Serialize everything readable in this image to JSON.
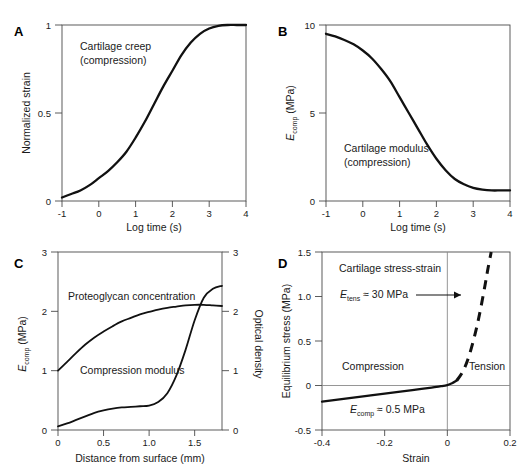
{
  "figure": {
    "caption_fragment": ""
  },
  "panels": {
    "A": {
      "letter": "A",
      "annotation_line1": "Cartilage creep",
      "annotation_line2": "(compression)",
      "xlabel": "Log time (s)",
      "ylabel": "Normalized strain",
      "xticks": [
        "-1",
        "0",
        "1",
        "2",
        "3",
        "4"
      ],
      "yticks": [
        "0",
        "0.5",
        "1"
      ]
    },
    "B": {
      "letter": "B",
      "annotation_line1": "Cartilage modulus",
      "annotation_line2": "(compression)",
      "xlabel": "Log time (s)",
      "ylabel_main": "E",
      "ylabel_sub": "comp",
      "ylabel_unit": " (MPa)",
      "xticks": [
        "-1",
        "0",
        "1",
        "2",
        "3",
        "4"
      ],
      "yticks": [
        "0",
        "5",
        "10"
      ]
    },
    "C": {
      "letter": "C",
      "annotation_upper": "Proteoglycan concentration",
      "annotation_lower": "Compression modulus",
      "xlabel": "Distance from surface (mm)",
      "ylabel_left_main": "E",
      "ylabel_left_sub": "comp",
      "ylabel_left_unit": " (MPa)",
      "ylabel_right": "Optical density",
      "xticks": [
        "0",
        "0.5",
        "1.0",
        "1.5"
      ],
      "yticks_left": [
        "0",
        "1",
        "2",
        "3"
      ],
      "yticks_right": [
        "0",
        "1",
        "2",
        "3"
      ]
    },
    "D": {
      "letter": "D",
      "title": "Cartilage stress-strain",
      "label_compression": "Compression",
      "label_tension": "Tension",
      "annot_tens_main": "E",
      "annot_tens_sub": "tens",
      "annot_tens_rest": " ≈ 30 MPa",
      "annot_comp_main": "E",
      "annot_comp_sub": "comp",
      "annot_comp_rest": " ≈ 0.5 MPa",
      "xlabel": "Strain",
      "ylabel": "Equilibrium stress (MPa)",
      "xticks": [
        "-0.4",
        "-0.2",
        "0",
        "0.2"
      ],
      "yticks": [
        "-0.5",
        "0",
        "0.5",
        "1.0",
        "1.5"
      ]
    }
  },
  "chart_data": [
    {
      "panel": "A",
      "type": "line",
      "title": "Cartilage creep (compression)",
      "xlabel": "Log time (s)",
      "ylabel": "Normalized strain",
      "xlim": [
        -1,
        4
      ],
      "ylim": [
        0,
        1
      ],
      "grid": false,
      "series": [
        {
          "name": "Normalized creep strain",
          "x": [
            -1.0,
            -0.75,
            -0.5,
            -0.25,
            0.0,
            0.25,
            0.5,
            0.75,
            1.0,
            1.25,
            1.5,
            1.75,
            2.0,
            2.25,
            2.5,
            2.75,
            3.0,
            3.25,
            3.5,
            3.75,
            4.0
          ],
          "y": [
            0.02,
            0.04,
            0.06,
            0.09,
            0.13,
            0.17,
            0.22,
            0.28,
            0.36,
            0.45,
            0.55,
            0.65,
            0.74,
            0.83,
            0.9,
            0.95,
            0.98,
            0.995,
            1.0,
            1.0,
            1.0
          ]
        }
      ]
    },
    {
      "panel": "B",
      "type": "line",
      "title": "Cartilage modulus (compression)",
      "xlabel": "Log time (s)",
      "ylabel": "E_comp (MPa)",
      "xlim": [
        -1,
        4
      ],
      "ylim": [
        0,
        10
      ],
      "grid": false,
      "series": [
        {
          "name": "Compressive modulus",
          "x": [
            -1.0,
            -0.75,
            -0.5,
            -0.25,
            0.0,
            0.25,
            0.5,
            0.75,
            1.0,
            1.25,
            1.5,
            1.75,
            2.0,
            2.25,
            2.5,
            2.75,
            3.0,
            3.25,
            3.5,
            3.75,
            4.0
          ],
          "y": [
            9.5,
            9.35,
            9.15,
            8.9,
            8.55,
            8.1,
            7.5,
            6.8,
            5.9,
            5.0,
            4.1,
            3.2,
            2.4,
            1.75,
            1.25,
            0.95,
            0.75,
            0.65,
            0.6,
            0.6,
            0.6
          ]
        }
      ]
    },
    {
      "panel": "C",
      "type": "line",
      "title": "Depth-dependent cartilage properties",
      "xlabel": "Distance from surface (mm)",
      "ylabel_left": "E_comp (MPa)",
      "ylabel_right": "Optical density",
      "xlim": [
        0,
        1.8
      ],
      "ylim_left": [
        0,
        3
      ],
      "ylim_right": [
        0,
        3
      ],
      "grid": false,
      "series": [
        {
          "name": "Proteoglycan concentration",
          "axis": "right",
          "x": [
            0.0,
            0.1,
            0.2,
            0.3,
            0.4,
            0.5,
            0.6,
            0.7,
            0.8,
            0.9,
            1.0,
            1.1,
            1.2,
            1.3,
            1.4,
            1.5,
            1.6,
            1.7,
            1.8
          ],
          "y": [
            1.0,
            1.15,
            1.3,
            1.44,
            1.56,
            1.66,
            1.75,
            1.83,
            1.89,
            1.95,
            1.99,
            2.03,
            2.06,
            2.08,
            2.1,
            2.11,
            2.11,
            2.1,
            2.09
          ]
        },
        {
          "name": "Compression modulus",
          "axis": "left",
          "x": [
            0.0,
            0.1,
            0.2,
            0.3,
            0.4,
            0.5,
            0.6,
            0.7,
            0.8,
            0.9,
            1.0,
            1.1,
            1.2,
            1.3,
            1.4,
            1.5,
            1.6,
            1.7,
            1.8
          ],
          "y": [
            0.06,
            0.11,
            0.17,
            0.23,
            0.29,
            0.33,
            0.36,
            0.38,
            0.39,
            0.4,
            0.41,
            0.47,
            0.62,
            0.92,
            1.35,
            1.85,
            2.23,
            2.38,
            2.43
          ]
        }
      ]
    },
    {
      "panel": "D",
      "type": "line",
      "title": "Cartilage stress-strain",
      "xlabel": "Strain",
      "ylabel": "Equilibrium stress (MPa)",
      "xlim": [
        -0.4,
        0.2
      ],
      "ylim": [
        -0.5,
        1.5
      ],
      "grid": false,
      "annotations": [
        "E_tens ≈ 30 MPa",
        "E_comp ≈ 0.5 MPa",
        "Compression",
        "Tension"
      ],
      "series": [
        {
          "name": "Compression branch",
          "style": "solid",
          "x": [
            -0.4,
            -0.35,
            -0.3,
            -0.25,
            -0.2,
            -0.15,
            -0.1,
            -0.05,
            -0.02,
            0.0,
            0.015,
            0.03
          ],
          "y": [
            -0.18,
            -0.158,
            -0.136,
            -0.114,
            -0.092,
            -0.07,
            -0.047,
            -0.023,
            -0.008,
            0.005,
            0.025,
            0.055
          ]
        },
        {
          "name": "Tension branch",
          "style": "dashed",
          "x": [
            0.03,
            0.05,
            0.07,
            0.09,
            0.105,
            0.12,
            0.13,
            0.14
          ],
          "y": [
            0.055,
            0.16,
            0.34,
            0.6,
            0.84,
            1.12,
            1.32,
            1.5
          ]
        }
      ]
    }
  ]
}
